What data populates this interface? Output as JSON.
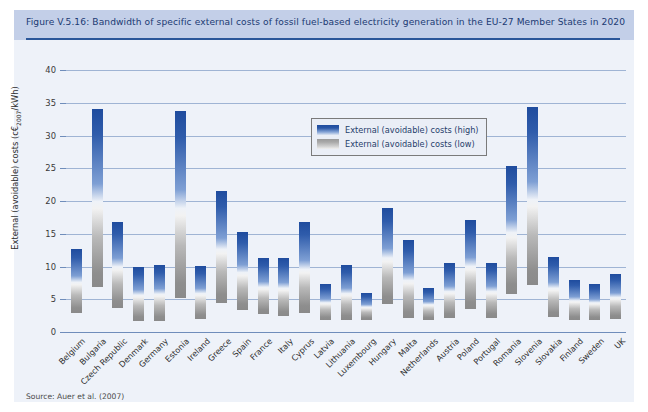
{
  "figure": {
    "title": "Figure V.5.16: Bandwidth of specific external costs of fossil fuel-based electricity generation in the EU-27 Member States in 2020",
    "source": "Source: Auer et al. (2007)"
  },
  "legend": {
    "position": "top-center-inside",
    "entries": [
      {
        "label": "External (avoidable) costs (high)",
        "color": "#1f4c9e"
      },
      {
        "label": "External (avoidable) costs (low)",
        "color": "#8e8e8e"
      }
    ]
  },
  "axis": {
    "y_title_main": "External (avoidable) costs (c€",
    "y_title_sub": "2007",
    "y_title_tail": "/kWh)",
    "y_ticks": [
      "0",
      "5",
      "10",
      "15",
      "20",
      "25",
      "30",
      "35",
      "40"
    ]
  },
  "colors": {
    "panel_background": "#eef2f9",
    "title_bar": "#c3cfe8",
    "title_text": "#1b3a73",
    "title_rule": "#2a5699",
    "gridline": "#9fb4d4",
    "bar_high": "#1f4c9e",
    "bar_low": "#8e8e8e"
  },
  "chart_data": {
    "type": "bar",
    "title": "Bandwidth of specific external costs of fossil fuel-based electricity generation in the EU-27 Member States in 2020",
    "xlabel": "",
    "ylabel": "External (avoidable) costs (c€2007/kWh)",
    "ylim": [
      0,
      40
    ],
    "ytick_step": 5,
    "grid": true,
    "note": "Each bar is a floating range spanning from the low estimate to the high estimate.",
    "categories": [
      "Belgium",
      "Bulgaria",
      "Czech Republic",
      "Denmark",
      "Germany",
      "Estonia",
      "Ireland",
      "Greece",
      "Spain",
      "France",
      "Italy",
      "Cyprus",
      "Latvia",
      "Lithuania",
      "Luxembourg",
      "Hungary",
      "Malta",
      "Netherlands",
      "Austria",
      "Poland",
      "Portugal",
      "Romania",
      "Slovenia",
      "Slovakia",
      "Finland",
      "Sweden",
      "UK"
    ],
    "series": [
      {
        "name": "External (avoidable) costs (low)",
        "values": [
          2.9,
          6.8,
          3.7,
          1.7,
          1.7,
          5.2,
          2.0,
          4.4,
          3.4,
          2.7,
          2.4,
          2.9,
          1.8,
          1.8,
          1.9,
          4.3,
          2.2,
          1.9,
          2.1,
          3.5,
          2.1,
          5.8,
          7.2,
          2.3,
          1.9,
          1.9,
          2.0
        ]
      },
      {
        "name": "External (avoidable) costs (high)",
        "values": [
          12.7,
          34.0,
          16.8,
          9.9,
          10.2,
          33.8,
          10.1,
          21.6,
          15.2,
          11.3,
          11.3,
          16.8,
          7.4,
          10.2,
          6.0,
          19.0,
          14.1,
          6.7,
          10.6,
          17.1,
          10.5,
          25.4,
          34.3,
          11.5,
          8.0,
          7.4,
          8.9
        ]
      }
    ]
  }
}
